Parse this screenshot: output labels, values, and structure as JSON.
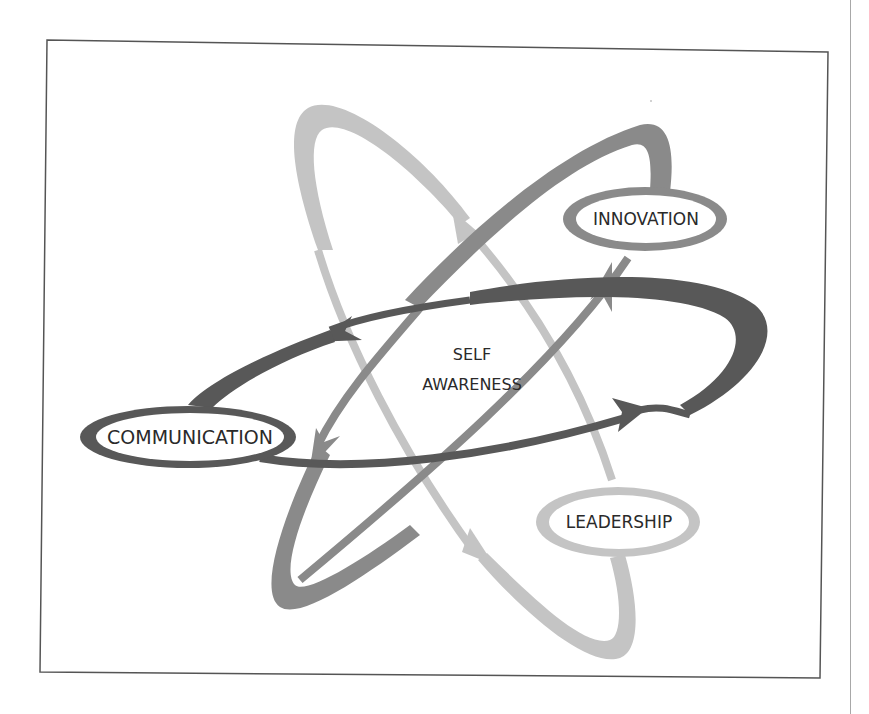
{
  "diagram": {
    "center_label": {
      "line1": "SELF",
      "line2": "AWARENESS"
    },
    "nodes": [
      {
        "id": "communication",
        "label": "COMMUNICATION",
        "ring_color": "#585858"
      },
      {
        "id": "innovation",
        "label": "INNOVATION",
        "ring_color": "#8a8a8a"
      },
      {
        "id": "leadership",
        "label": "LEADERSHIP",
        "ring_color": "#c4c4c4"
      }
    ],
    "colors": {
      "dark_orbit": "#585858",
      "medium_orbit": "#8a8a8a",
      "light_orbit": "#c4c4c4",
      "frame": "#555555",
      "text": "#2a2a2a",
      "background": "#ffffff"
    }
  }
}
